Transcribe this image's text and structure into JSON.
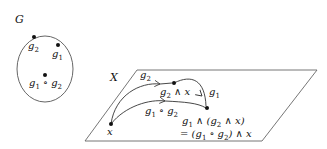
{
  "group": {
    "name": "G",
    "elements": [
      {
        "id": "g2",
        "label": "g",
        "sub": "2"
      },
      {
        "id": "g1",
        "label": "g",
        "sub": "1"
      },
      {
        "id": "g1g2",
        "label_parts": [
          "g",
          "1",
          " ∘ g",
          "2"
        ]
      }
    ]
  },
  "space": {
    "name": "X",
    "points": {
      "x": "x",
      "g2x": {
        "text": "g₂ ∧ x"
      },
      "result_line1": "g₁ ∧ (g₂ ∧ x)",
      "result_line2": "= (g₁ ∘ g₂) ∧ x"
    },
    "arrows": [
      {
        "from": "x",
        "to": "g2x",
        "label": "g₂"
      },
      {
        "from": "g2x",
        "to": "result",
        "label": "g₁"
      },
      {
        "from": "x",
        "to": "result",
        "label": "g₁ ∘ g₂"
      }
    ]
  },
  "colors": {
    "stroke": "#555555",
    "ink": "#111111"
  }
}
